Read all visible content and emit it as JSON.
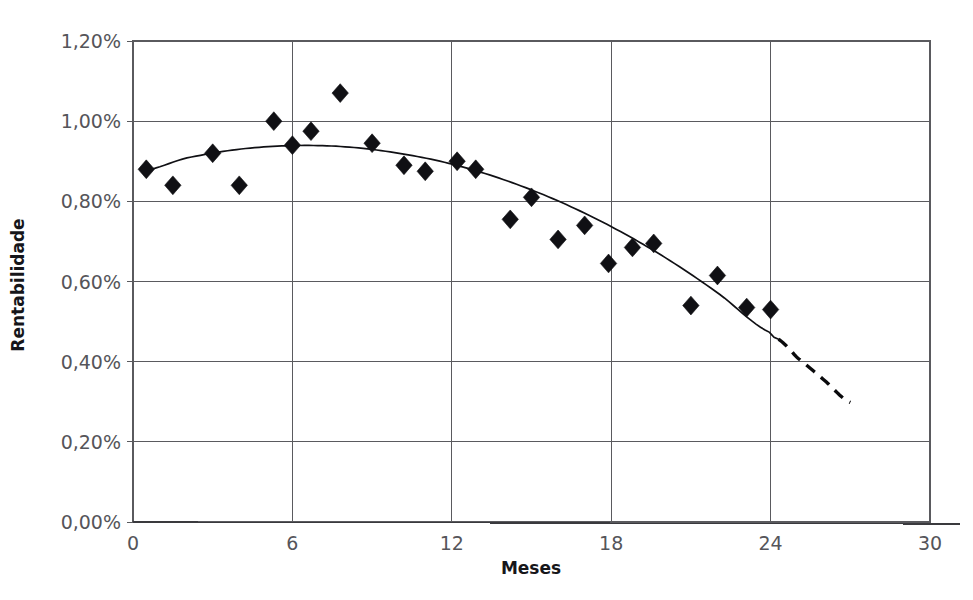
{
  "chart_data": {
    "type": "scatter",
    "title": "",
    "xlabel": "Meses",
    "ylabel": "Rentabilidade",
    "xlim": [
      0,
      30
    ],
    "ylim": [
      0,
      1.2
    ],
    "grid": true,
    "legend": false,
    "x_ticks": [
      "0",
      "6",
      "12",
      "18",
      "24",
      "30"
    ],
    "x_tick_values": [
      0,
      6,
      12,
      18,
      24,
      30
    ],
    "y_ticks": [
      "0,00%",
      "0,20%",
      "0,40%",
      "0,60%",
      "0,80%",
      "1,00%",
      "1,20%"
    ],
    "y_tick_values": [
      0,
      0.2,
      0.4,
      0.6,
      0.8,
      1.0,
      1.2
    ],
    "series": [
      {
        "name": "Rentabilidade observada",
        "marker": "diamond",
        "color": "#101014",
        "x": [
          0.5,
          1.5,
          3.0,
          4.0,
          5.3,
          6.0,
          6.7,
          7.8,
          9.0,
          10.2,
          11.0,
          12.2,
          12.9,
          14.2,
          15.0,
          16.0,
          17.0,
          17.9,
          18.8,
          19.6,
          21.0,
          22.0,
          23.1,
          24.0
        ],
        "y": [
          0.88,
          0.84,
          0.92,
          0.84,
          1.0,
          0.94,
          0.975,
          1.07,
          0.945,
          0.89,
          0.875,
          0.9,
          0.88,
          0.755,
          0.81,
          0.705,
          0.74,
          0.645,
          0.685,
          0.695,
          0.54,
          0.615,
          0.535,
          0.53
        ]
      }
    ],
    "trendline": {
      "name": "Tendencia polinomial",
      "type": "polynomial",
      "degree": 2,
      "color": "#101014",
      "solid_range": [
        0.5,
        24.3
      ],
      "dashed_range": [
        24.3,
        27.0
      ],
      "points_x": [
        0.5,
        2.0,
        4.0,
        6.0,
        8.0,
        10.0,
        12.0,
        14.0,
        16.0,
        18.0,
        20.0,
        22.0,
        24.0,
        24.3,
        25.0,
        26.0,
        27.0
      ],
      "points_y": [
        0.878,
        0.908,
        0.93,
        0.939,
        0.936,
        0.92,
        0.893,
        0.853,
        0.801,
        0.737,
        0.661,
        0.572,
        0.472,
        0.456,
        0.41,
        0.355,
        0.298
      ]
    }
  },
  "axis": {
    "x_title": "Meses",
    "y_title": "Rentabilidade"
  }
}
